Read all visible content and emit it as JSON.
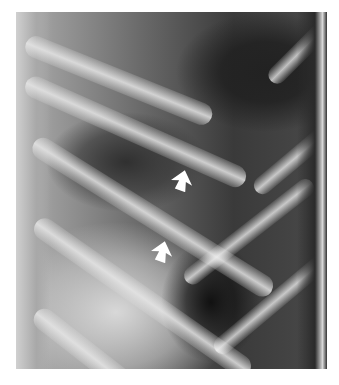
{
  "image": {
    "type": "radiograph",
    "subject": "chest x-ray, ribs and lung field",
    "annotations": [
      {
        "kind": "arrow",
        "color": "#ffffff",
        "direction": "up-left",
        "x": 182,
        "y": 183
      },
      {
        "kind": "arrow",
        "color": "#ffffff",
        "direction": "up-left",
        "x": 162,
        "y": 254
      }
    ]
  }
}
